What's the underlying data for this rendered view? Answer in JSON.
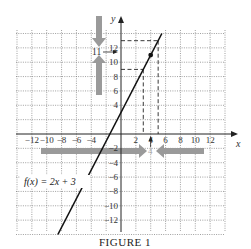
{
  "chart_data": {
    "type": "line",
    "title": "",
    "caption": "FIGURE 1",
    "xlabel": "x",
    "ylabel": "y",
    "xlim": [
      -14,
      14
    ],
    "ylim": [
      -14,
      14
    ],
    "grid": true,
    "grid_step": 2,
    "x_tick_labels": [
      "−12",
      "−10",
      "−8",
      "−6",
      "−4",
      "2",
      "4",
      "6",
      "8",
      "10",
      "12"
    ],
    "y_tick_labels": [
      "12",
      "10",
      "8",
      "6",
      "4",
      "−2",
      "−4",
      "−6",
      "−8",
      "−10",
      "−12"
    ],
    "series": [
      {
        "name": "f(x) = 2x + 3",
        "slope": 2,
        "intercept": 3,
        "x": [
          -8.5,
          5.5
        ],
        "y": [
          -14,
          14
        ]
      }
    ],
    "highlight_point": {
      "x": 4,
      "y": 11
    },
    "dashed_guides": [
      {
        "x": 3,
        "y": 9
      },
      {
        "x": 5,
        "y": 13
      }
    ],
    "annotations": [
      {
        "text": "11",
        "position": "y-axis",
        "value": 11,
        "note": "limit value approached from above and below"
      },
      {
        "text": "4",
        "position": "x-axis",
        "value": 4,
        "note": "x approaches 4 from left and right"
      }
    ]
  },
  "labels": {
    "function": "f(x) = 2x + 3",
    "caption": "FIGURE 1",
    "x_axis": "x",
    "y_axis": "y",
    "y_limit_label": "11",
    "x_limit_label": "4"
  }
}
